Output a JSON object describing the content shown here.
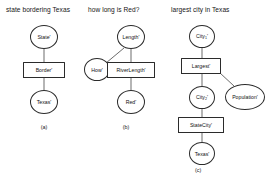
{
  "figure": {
    "panels": [
      {
        "id": "a",
        "title": "state bordering Texas",
        "caption": "(a)",
        "nodes": [
          {
            "id": "state",
            "label": "State'",
            "shape": "circle"
          },
          {
            "id": "border",
            "label": "Border'",
            "shape": "rect"
          },
          {
            "id": "texas",
            "label": "Texas'",
            "shape": "circle"
          }
        ],
        "edges": [
          {
            "from": "state",
            "to": "border"
          },
          {
            "from": "border",
            "to": "texas"
          }
        ]
      },
      {
        "id": "b",
        "title": "how long is Red?",
        "caption": "(b)",
        "nodes": [
          {
            "id": "length",
            "label": "Length'",
            "shape": "circle"
          },
          {
            "id": "how",
            "label": "How'",
            "shape": "circle"
          },
          {
            "id": "riverlength",
            "label": "RiverLength'",
            "shape": "rect"
          },
          {
            "id": "red",
            "label": "Red'",
            "shape": "circle"
          }
        ],
        "edges": [
          {
            "from": "length",
            "to": "how"
          },
          {
            "from": "length",
            "to": "riverlength"
          },
          {
            "from": "riverlength",
            "to": "red"
          }
        ]
      },
      {
        "id": "c",
        "title": "largest city in Texas",
        "caption": "(c)",
        "nodes": [
          {
            "id": "city1",
            "label": "City",
            "sub": "1",
            "prime": "'",
            "shape": "circle"
          },
          {
            "id": "largest",
            "label": "Largest'",
            "shape": "rect"
          },
          {
            "id": "population",
            "label": "Population'",
            "shape": "circle"
          },
          {
            "id": "city2",
            "label": "City",
            "sub": "2",
            "prime": "'",
            "shape": "circle"
          },
          {
            "id": "statecity",
            "label": "StateCity'",
            "shape": "rect"
          },
          {
            "id": "texas",
            "label": "Texas'",
            "shape": "circle"
          }
        ],
        "edges": [
          {
            "from": "city1",
            "to": "largest"
          },
          {
            "from": "largest",
            "to": "population"
          },
          {
            "from": "largest",
            "to": "city2"
          },
          {
            "from": "city2",
            "to": "statecity"
          },
          {
            "from": "statecity",
            "to": "texas"
          }
        ]
      }
    ]
  },
  "style": {
    "stroke_color": "#2b2b2b",
    "text_color": "#111111",
    "background": "#ffffff"
  }
}
